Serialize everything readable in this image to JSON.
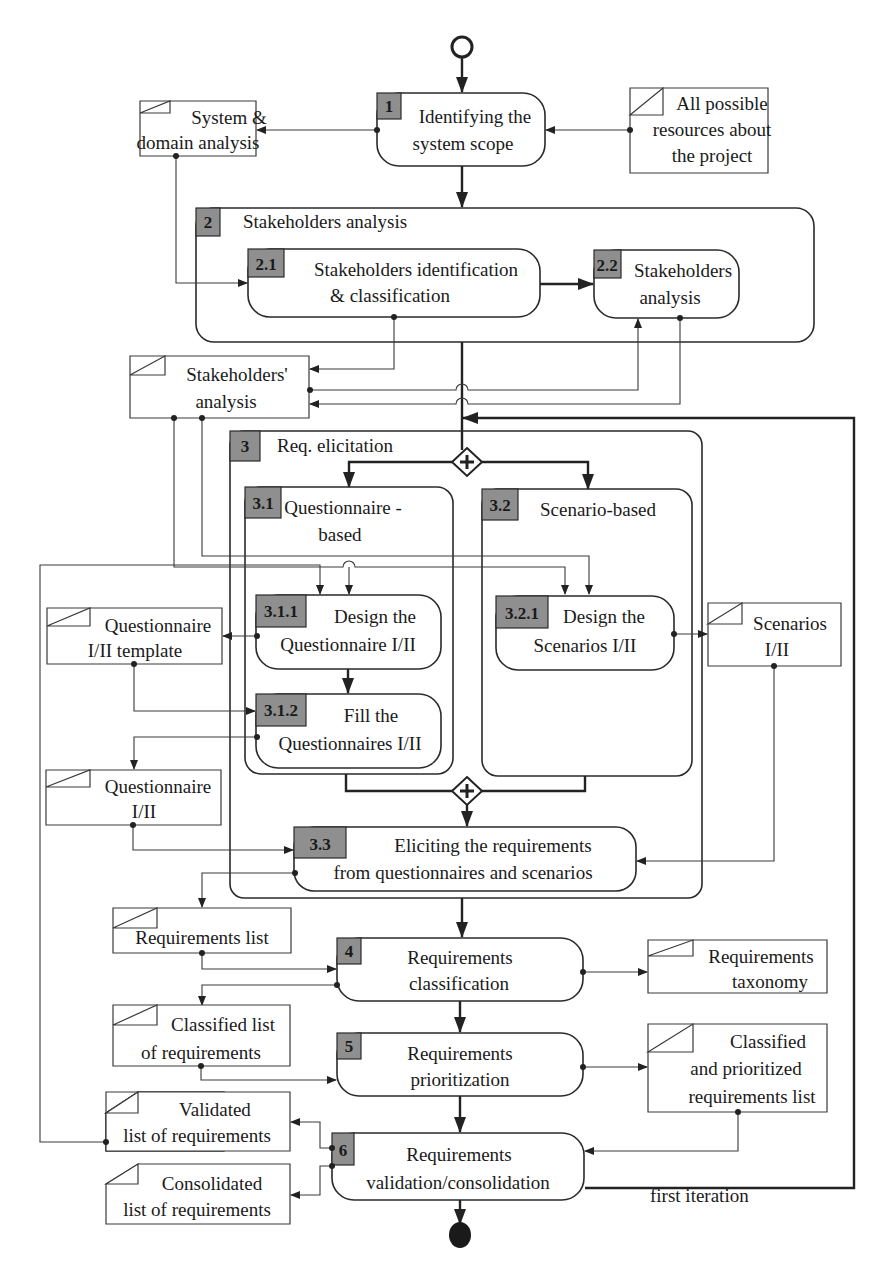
{
  "diagram": {
    "type": "activity-flow",
    "start_node": "initial",
    "end_node": "final",
    "activities": [
      {
        "id": "1",
        "label": [
          "Identifying the",
          "system scope"
        ]
      },
      {
        "id": "2",
        "label": [
          "Stakeholders analysis"
        ],
        "group": true
      },
      {
        "id": "2.1",
        "label": [
          "Stakeholders identification",
          "& classification"
        ]
      },
      {
        "id": "2.2",
        "label": [
          "Stakeholders",
          "analysis"
        ]
      },
      {
        "id": "3",
        "label": [
          "Req. elicitation"
        ],
        "group": true
      },
      {
        "id": "3.1",
        "label": [
          "Questionnaire -",
          "based"
        ],
        "group": true
      },
      {
        "id": "3.1.1",
        "label": [
          "Design the",
          "Questionnaire I/II"
        ]
      },
      {
        "id": "3.1.2",
        "label": [
          "Fill the",
          "Questionnaires I/II"
        ]
      },
      {
        "id": "3.2",
        "label": [
          "Scenario-based"
        ],
        "group": true
      },
      {
        "id": "3.2.1",
        "label": [
          "Design the",
          "Scenarios I/II"
        ]
      },
      {
        "id": "3.3",
        "label": [
          "Eliciting the requirements",
          "from questionnaires  and scenarios"
        ]
      },
      {
        "id": "4",
        "label": [
          "Requirements",
          "classification"
        ]
      },
      {
        "id": "5",
        "label": [
          "Requirements",
          "prioritization"
        ]
      },
      {
        "id": "6",
        "label": [
          "Requirements",
          "validation/consolidation"
        ]
      }
    ],
    "artifacts": [
      {
        "id": "sys_domain",
        "label": [
          "System &",
          "domain analysis"
        ]
      },
      {
        "id": "resources",
        "label": [
          "All possible",
          "resources about",
          "the project"
        ]
      },
      {
        "id": "stake_analysis",
        "label": [
          "Stakeholders'",
          "analysis"
        ]
      },
      {
        "id": "q_template",
        "label": [
          "Questionnaire",
          "I/II template"
        ]
      },
      {
        "id": "questionnaire",
        "label": [
          "Questionnaire",
          "I/II"
        ]
      },
      {
        "id": "scenarios",
        "label": [
          "Scenarios",
          "I/II"
        ]
      },
      {
        "id": "req_list",
        "label": [
          "Requirements list"
        ]
      },
      {
        "id": "req_taxonomy",
        "label": [
          "Requirements",
          "taxonomy"
        ]
      },
      {
        "id": "classified_list",
        "label": [
          "Classified  list",
          "of requirements"
        ]
      },
      {
        "id": "prioritized_list",
        "label": [
          "Classified",
          "and prioritized",
          "requirements list"
        ]
      },
      {
        "id": "validated_list",
        "label": [
          "Validated",
          "list of requirements"
        ]
      },
      {
        "id": "consolidated_list",
        "label": [
          "Consolidated",
          "list of requirements"
        ]
      }
    ],
    "annotations": {
      "loop_label": "first iteration",
      "fork_symbol": "+",
      "join_symbol": "+"
    }
  }
}
